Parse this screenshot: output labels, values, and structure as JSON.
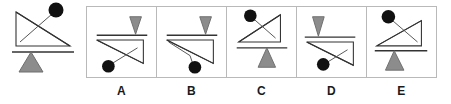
{
  "puzzle": {
    "type": "visual-analogy-rotation",
    "prompt_figure_label": "",
    "stem": {
      "name": "reference-figure",
      "description": "right triangle on a balance fulcrum with suspended ball",
      "orientation": "upright",
      "right_angle_corner": "bottom-left",
      "ball_position": "above-upper-right",
      "fulcrum_position": "below"
    },
    "options": [
      {
        "label": "A",
        "orientation": "vertical-flip",
        "right_angle_corner": "top-left",
        "ball_position": "below-lower-left",
        "fulcrum_position": "above",
        "fulcrum_direction": "down"
      },
      {
        "label": "B",
        "orientation": "vertical-flip-bent-tether",
        "right_angle_corner": "top-left",
        "ball_position": "below-lower-center",
        "fulcrum_position": "above",
        "fulcrum_direction": "down"
      },
      {
        "label": "C",
        "orientation": "horizontal-mirror",
        "right_angle_corner": "bottom-right",
        "ball_position": "above-upper-left",
        "fulcrum_position": "below",
        "fulcrum_direction": "up"
      },
      {
        "label": "D",
        "orientation": "vertical-flip",
        "right_angle_corner": "top-left",
        "ball_position": "below-lower-center",
        "fulcrum_position": "above",
        "fulcrum_direction": "down"
      },
      {
        "label": "E",
        "orientation": "horizontal-mirror",
        "right_angle_corner": "bottom-right",
        "ball_position": "above-upper-left",
        "fulcrum_position": "below",
        "fulcrum_direction": "up"
      }
    ],
    "colors": {
      "stroke": "#333333",
      "ball": "#111111",
      "fulcrum_fill": "#8c8c8c",
      "fulcrum_stroke": "#6e6e6e",
      "cell_border": "#b9b9b9",
      "background": "#ffffff",
      "label_text": "#1a1a1a"
    }
  }
}
